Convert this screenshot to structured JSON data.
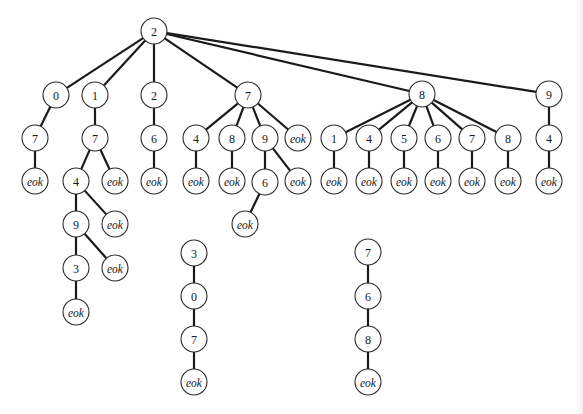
{
  "diagram": {
    "type": "tree",
    "terminal_label": "eok",
    "trees": [
      {
        "name": "main-tree",
        "root": {
          "label": "2",
          "children": [
            {
              "label": "0",
              "children": [
                {
                  "label": "7",
                  "children": [
                    {
                      "label": "eok"
                    }
                  ]
                }
              ]
            },
            {
              "label": "1",
              "children": [
                {
                  "label": "7",
                  "children": [
                    {
                      "label": "4",
                      "children": [
                        {
                          "label": "9",
                          "children": [
                            {
                              "label": "3",
                              "children": [
                                {
                                  "label": "eok"
                                }
                              ]
                            },
                            {
                              "label": "eok"
                            }
                          ]
                        },
                        {
                          "label": "eok"
                        }
                      ]
                    },
                    {
                      "label": "eok"
                    }
                  ]
                }
              ]
            },
            {
              "label": "2",
              "children": [
                {
                  "label": "6",
                  "children": [
                    {
                      "label": "eok"
                    }
                  ]
                }
              ]
            },
            {
              "label": "7",
              "children": [
                {
                  "label": "4",
                  "children": [
                    {
                      "label": "eok"
                    }
                  ]
                },
                {
                  "label": "8",
                  "children": [
                    {
                      "label": "eok"
                    }
                  ]
                },
                {
                  "label": "9",
                  "children": [
                    {
                      "label": "6",
                      "children": [
                        {
                          "label": "eok"
                        }
                      ]
                    },
                    {
                      "label": "eok"
                    }
                  ]
                },
                {
                  "label": "eok"
                }
              ]
            },
            {
              "label": "8",
              "children": [
                {
                  "label": "1",
                  "children": [
                    {
                      "label": "eok"
                    }
                  ]
                },
                {
                  "label": "4",
                  "children": [
                    {
                      "label": "eok"
                    }
                  ]
                },
                {
                  "label": "5",
                  "children": [
                    {
                      "label": "eok"
                    }
                  ]
                },
                {
                  "label": "6",
                  "children": [
                    {
                      "label": "eok"
                    }
                  ]
                },
                {
                  "label": "7",
                  "children": [
                    {
                      "label": "eok"
                    }
                  ]
                },
                {
                  "label": "8",
                  "children": [
                    {
                      "label": "eok"
                    }
                  ]
                }
              ]
            },
            {
              "label": "9",
              "children": [
                {
                  "label": "4",
                  "children": [
                    {
                      "label": "eok"
                    }
                  ]
                }
              ]
            }
          ]
        }
      },
      {
        "name": "chain-3-0-7",
        "root": {
          "label": "3",
          "children": [
            {
              "label": "0",
              "children": [
                {
                  "label": "7",
                  "children": [
                    {
                      "label": "eok"
                    }
                  ]
                }
              ]
            }
          ]
        }
      },
      {
        "name": "chain-7-6-8",
        "root": {
          "label": "7",
          "children": [
            {
              "label": "6",
              "children": [
                {
                  "label": "8",
                  "children": [
                    {
                      "label": "eok"
                    }
                  ]
                }
              ]
            }
          ]
        }
      }
    ],
    "nodes": [
      {
        "id": "r",
        "label": "2",
        "x": 154,
        "y": 31
      },
      {
        "id": "a",
        "label": "0",
        "x": 56,
        "y": 95
      },
      {
        "id": "a1",
        "label": "7",
        "x": 35,
        "y": 138
      },
      {
        "id": "a2",
        "label": "eok",
        "x": 35,
        "y": 181
      },
      {
        "id": "b",
        "label": "1",
        "x": 95,
        "y": 95
      },
      {
        "id": "b1",
        "label": "7",
        "x": 95,
        "y": 138
      },
      {
        "id": "b2",
        "label": "4",
        "x": 76,
        "y": 181
      },
      {
        "id": "b3",
        "label": "eok",
        "x": 115,
        "y": 181
      },
      {
        "id": "b4",
        "label": "9",
        "x": 76,
        "y": 224
      },
      {
        "id": "b5",
        "label": "eok",
        "x": 115,
        "y": 224
      },
      {
        "id": "b6",
        "label": "3",
        "x": 76,
        "y": 268
      },
      {
        "id": "b7",
        "label": "eok",
        "x": 115,
        "y": 268
      },
      {
        "id": "b8",
        "label": "eok",
        "x": 76,
        "y": 312
      },
      {
        "id": "c",
        "label": "2",
        "x": 154,
        "y": 95
      },
      {
        "id": "c1",
        "label": "6",
        "x": 154,
        "y": 138
      },
      {
        "id": "c2",
        "label": "eok",
        "x": 154,
        "y": 181
      },
      {
        "id": "d",
        "label": "7",
        "x": 248,
        "y": 95
      },
      {
        "id": "d1",
        "label": "4",
        "x": 196,
        "y": 138
      },
      {
        "id": "d1e",
        "label": "eok",
        "x": 196,
        "y": 181
      },
      {
        "id": "d2",
        "label": "8",
        "x": 232,
        "y": 138
      },
      {
        "id": "d2e",
        "label": "eok",
        "x": 232,
        "y": 181
      },
      {
        "id": "d3",
        "label": "9",
        "x": 265,
        "y": 138
      },
      {
        "id": "d3a",
        "label": "6",
        "x": 265,
        "y": 182
      },
      {
        "id": "d3ae",
        "label": "eok",
        "x": 245,
        "y": 224
      },
      {
        "id": "d3b",
        "label": "eok",
        "x": 298,
        "y": 181
      },
      {
        "id": "d4",
        "label": "eok",
        "x": 298,
        "y": 138
      },
      {
        "id": "e",
        "label": "8",
        "x": 422,
        "y": 94
      },
      {
        "id": "e1",
        "label": "1",
        "x": 334,
        "y": 138
      },
      {
        "id": "e1e",
        "label": "eok",
        "x": 334,
        "y": 181
      },
      {
        "id": "e2",
        "label": "4",
        "x": 369,
        "y": 138
      },
      {
        "id": "e2e",
        "label": "eok",
        "x": 369,
        "y": 181
      },
      {
        "id": "e3",
        "label": "5",
        "x": 404,
        "y": 138
      },
      {
        "id": "e3e",
        "label": "eok",
        "x": 404,
        "y": 181
      },
      {
        "id": "e4",
        "label": "6",
        "x": 438,
        "y": 138
      },
      {
        "id": "e4e",
        "label": "eok",
        "x": 438,
        "y": 181
      },
      {
        "id": "e5",
        "label": "7",
        "x": 472,
        "y": 138
      },
      {
        "id": "e5e",
        "label": "eok",
        "x": 472,
        "y": 181
      },
      {
        "id": "e6",
        "label": "8",
        "x": 508,
        "y": 138
      },
      {
        "id": "e6e",
        "label": "eok",
        "x": 508,
        "y": 181
      },
      {
        "id": "f",
        "label": "9",
        "x": 549,
        "y": 94
      },
      {
        "id": "f1",
        "label": "4",
        "x": 549,
        "y": 138
      },
      {
        "id": "f2",
        "label": "eok",
        "x": 549,
        "y": 181
      },
      {
        "id": "g1",
        "label": "3",
        "x": 194,
        "y": 253
      },
      {
        "id": "g2",
        "label": "0",
        "x": 194,
        "y": 296
      },
      {
        "id": "g3",
        "label": "7",
        "x": 194,
        "y": 339
      },
      {
        "id": "g4",
        "label": "eok",
        "x": 194,
        "y": 382
      },
      {
        "id": "h1",
        "label": "7",
        "x": 368,
        "y": 252
      },
      {
        "id": "h2",
        "label": "6",
        "x": 368,
        "y": 296
      },
      {
        "id": "h3",
        "label": "8",
        "x": 368,
        "y": 339
      },
      {
        "id": "h4",
        "label": "eok",
        "x": 368,
        "y": 382
      }
    ],
    "edges": [
      [
        "r",
        "a"
      ],
      [
        "r",
        "b"
      ],
      [
        "r",
        "c"
      ],
      [
        "r",
        "d"
      ],
      [
        "r",
        "e"
      ],
      [
        "r",
        "f"
      ],
      [
        "a",
        "a1"
      ],
      [
        "a1",
        "a2"
      ],
      [
        "b",
        "b1"
      ],
      [
        "b1",
        "b2"
      ],
      [
        "b1",
        "b3"
      ],
      [
        "b2",
        "b4"
      ],
      [
        "b2",
        "b5"
      ],
      [
        "b4",
        "b6"
      ],
      [
        "b4",
        "b7"
      ],
      [
        "b6",
        "b8"
      ],
      [
        "c",
        "c1"
      ],
      [
        "c1",
        "c2"
      ],
      [
        "d",
        "d1"
      ],
      [
        "d",
        "d2"
      ],
      [
        "d",
        "d3"
      ],
      [
        "d",
        "d4"
      ],
      [
        "d1",
        "d1e"
      ],
      [
        "d2",
        "d2e"
      ],
      [
        "d3",
        "d3a"
      ],
      [
        "d3",
        "d3b"
      ],
      [
        "d3a",
        "d3ae"
      ],
      [
        "e",
        "e1"
      ],
      [
        "e",
        "e2"
      ],
      [
        "e",
        "e3"
      ],
      [
        "e",
        "e4"
      ],
      [
        "e",
        "e5"
      ],
      [
        "e",
        "e6"
      ],
      [
        "e1",
        "e1e"
      ],
      [
        "e2",
        "e2e"
      ],
      [
        "e3",
        "e3e"
      ],
      [
        "e4",
        "e4e"
      ],
      [
        "e5",
        "e5e"
      ],
      [
        "e6",
        "e6e"
      ],
      [
        "f",
        "f1"
      ],
      [
        "f1",
        "f2"
      ],
      [
        "g1",
        "g2"
      ],
      [
        "g2",
        "g3"
      ],
      [
        "g3",
        "g4"
      ],
      [
        "h1",
        "h2"
      ],
      [
        "h2",
        "h3"
      ],
      [
        "h3",
        "h4"
      ]
    ],
    "style": {
      "node_radius": 13,
      "node_fill": "#ffffff",
      "node_stroke": "#2a2a2a",
      "edge_color": "#1a1a1a",
      "background": "#ffffff"
    }
  }
}
